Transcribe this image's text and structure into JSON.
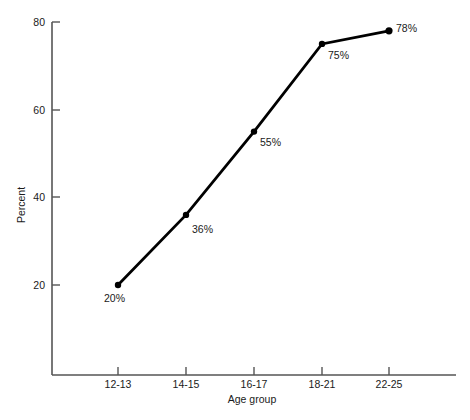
{
  "chart_data": {
    "type": "line",
    "title": "",
    "subtitle": "",
    "xlabel": "Age group",
    "ylabel": "Percent",
    "categories": [
      "12-13",
      "14-15",
      "16-17",
      "18-21",
      "22-25"
    ],
    "values": [
      20,
      36,
      55,
      75,
      78
    ],
    "point_labels": [
      "20%",
      "36%",
      "55%",
      "75%",
      "78%"
    ],
    "ylim": [
      0,
      80
    ],
    "yticks": [
      20,
      40,
      60,
      80
    ],
    "ytick_labels": [
      "20",
      "40",
      "60",
      "80"
    ],
    "grid": false,
    "legend": false,
    "legend_position": "none",
    "series": [
      {
        "name": "Percent",
        "values": [
          20,
          36,
          55,
          75,
          78
        ],
        "color": "#000000",
        "marker": "circle"
      }
    ]
  },
  "axes": {
    "y_axis_label": "Percent",
    "x_axis_label": "Age group",
    "y_tick_80": "80",
    "y_tick_60": "60",
    "y_tick_40": "40",
    "y_tick_20": "20",
    "x_tick_0": "12-13",
    "x_tick_1": "14-15",
    "x_tick_2": "16-17",
    "x_tick_3": "18-21",
    "x_tick_4": "22-25"
  },
  "labels": {
    "p0": "20%",
    "p1": "36%",
    "p2": "55%",
    "p3": "75%",
    "p4": "78%"
  },
  "colors": {
    "line": "#000000",
    "axis": "#555555",
    "text": "#1a1a1a",
    "background": "#ffffff"
  }
}
